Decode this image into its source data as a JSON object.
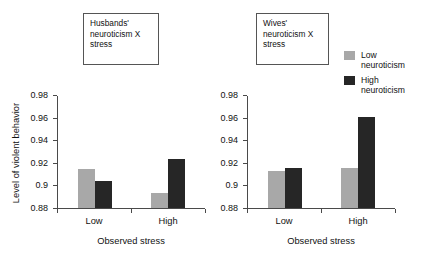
{
  "chart_data": [
    {
      "type": "bar",
      "title": "Husbands'\nneuroticism X\nstress",
      "xlabel": "Observed stress",
      "ylabel": "Level of violent behavior",
      "categories": [
        "Low",
        "High"
      ],
      "ylim": [
        0.88,
        0.98
      ],
      "yticks": [
        "0.88",
        "0.9",
        "0.92",
        "0.94",
        "0.96",
        "0.98"
      ],
      "ytick_values": [
        0.88,
        0.9,
        0.92,
        0.94,
        0.96,
        0.98
      ],
      "grid": false,
      "series": [
        {
          "name": "Low neuroticism",
          "color": "#a8a8a8",
          "values": [
            0.915,
            0.893
          ]
        },
        {
          "name": "High neuroticism",
          "color": "#262626",
          "values": [
            0.904,
            0.924
          ]
        }
      ]
    },
    {
      "type": "bar",
      "title": "Wives'\nneuroticism X\nstress",
      "xlabel": "Observed stress",
      "ylabel": "",
      "categories": [
        "Low",
        "High"
      ],
      "ylim": [
        0.88,
        0.98
      ],
      "yticks": [
        "0.88",
        "0.9",
        "0.92",
        "0.94",
        "0.96",
        "0.98"
      ],
      "ytick_values": [
        0.88,
        0.9,
        0.92,
        0.94,
        0.96,
        0.98
      ],
      "grid": false,
      "series": [
        {
          "name": "Low neuroticism",
          "color": "#a8a8a8",
          "values": [
            0.913,
            0.916
          ]
        },
        {
          "name": "High neuroticism",
          "color": "#262626",
          "values": [
            0.916,
            0.961
          ]
        }
      ]
    }
  ],
  "legend": {
    "position": "right",
    "entries": [
      {
        "label": "Low\nneuroticism",
        "color": "#a8a8a8"
      },
      {
        "label": "High\nneuroticism",
        "color": "#262626"
      }
    ]
  }
}
